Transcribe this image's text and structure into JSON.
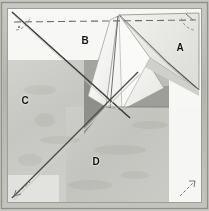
{
  "figure": {
    "kind": "paper-folding-diagram-photo",
    "sheet": {
      "shape": "square",
      "border_color": "#b9b9b4",
      "paper_color": "#f7f7f5",
      "shade_light": "#c9c9c5",
      "shade_mid": "#b0b0ac",
      "shade_dark": "#8e8e8a",
      "crease_color": "#4a4a4a",
      "dashed_color": "#6d6d6d"
    },
    "labels": [
      {
        "id": "A",
        "text": "A",
        "x": 180,
        "y": 48,
        "region": "right-folded-flap"
      },
      {
        "id": "B",
        "text": "B",
        "x": 85,
        "y": 41,
        "region": "upper-left-field"
      },
      {
        "id": "C",
        "text": "C",
        "x": 25,
        "y": 101,
        "region": "left-shaded-panel"
      },
      {
        "id": "D",
        "text": "D",
        "x": 96,
        "y": 162,
        "region": "lower-shaded-panel"
      }
    ],
    "annotations": {
      "top_dashed_fold": "horizontal dashed fold line near top edge",
      "corner_marks": [
        {
          "name": "top-left-angle-arc",
          "x": 18,
          "y": 18
        },
        {
          "name": "top-right-angle-arc",
          "x": 191,
          "y": 18
        },
        {
          "name": "bottom-left-arrow",
          "x": 20,
          "y": 190
        },
        {
          "name": "bottom-right-arrow",
          "x": 189,
          "y": 190
        }
      ],
      "main_diagonal": "corner-to-corner crease from top-left to bottom-right area",
      "anti_diagonal": "crease running from bottom-left corner upward to the right",
      "center_point": {
        "x": 106,
        "y": 106,
        "name": "fold-convergence-point"
      }
    }
  }
}
